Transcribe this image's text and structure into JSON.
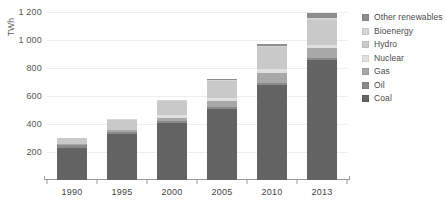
{
  "chart_data": {
    "type": "bar",
    "subtype": "stacked-bar",
    "title": "",
    "xlabel": "",
    "ylabel": "TWh",
    "ylim": [
      0,
      1200
    ],
    "ytick_step": 200,
    "yticks": [
      200,
      400,
      600,
      800,
      1000,
      1200
    ],
    "ytick_labels": [
      "200",
      "400",
      "600",
      "800",
      "1 000",
      "1 200"
    ],
    "grid": true,
    "grid_axis": "y",
    "legend_position": "right",
    "categories": [
      "1990",
      "1995",
      "2000",
      "2005",
      "2010",
      "2013"
    ],
    "series": [
      {
        "name": "Coal",
        "color": "#636363",
        "values": [
          230,
          330,
          405,
          510,
          680,
          860
        ]
      },
      {
        "name": "Oil",
        "color": "#8a8a8a",
        "values": [
          20,
          15,
          14,
          12,
          10,
          10
        ]
      },
      {
        "name": "Gas",
        "color": "#a8a8a8",
        "values": [
          10,
          14,
          25,
          40,
          72,
          72
        ]
      },
      {
        "name": "Nuclear",
        "color": "#e0e0e0",
        "values": [
          0,
          0,
          17,
          26,
          30,
          22
        ]
      },
      {
        "name": "Hydro",
        "color": "#c9c9c9",
        "values": [
          38,
          70,
          106,
          122,
          156,
          180
        ]
      },
      {
        "name": "Bioenergy",
        "color": "#d6d6d6",
        "values": [
          2,
          4,
          6,
          8,
          10,
          12
        ]
      },
      {
        "name": "Other renewables",
        "color": "#8d8d8d",
        "values": [
          0,
          2,
          2,
          2,
          12,
          34
        ]
      }
    ],
    "totals": [
      300,
      435,
      575,
      720,
      970,
      1190
    ],
    "stack_order_bottom_to_top": [
      "Coal",
      "Oil",
      "Gas",
      "Nuclear",
      "Hydro",
      "Bioenergy",
      "Other renewables"
    ]
  },
  "axis": {
    "y_title": "TWh"
  },
  "legend": {
    "items": [
      {
        "label": "Other renewables",
        "color": "#8d8d8d"
      },
      {
        "label": "Bioenergy",
        "color": "#d6d6d6"
      },
      {
        "label": "Hydro",
        "color": "#c9c9c9"
      },
      {
        "label": "Nuclear",
        "color": "#e0e0e0"
      },
      {
        "label": "Gas",
        "color": "#a8a8a8"
      },
      {
        "label": "Oil",
        "color": "#8a8a8a"
      },
      {
        "label": "Coal",
        "color": "#636363"
      }
    ]
  },
  "style": {
    "background": "#ffffff",
    "grid_color": "#ededed",
    "axis_color": "#9a9a9a",
    "tick_text_color": "#555555"
  }
}
